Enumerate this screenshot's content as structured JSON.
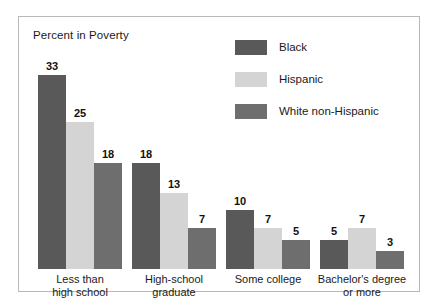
{
  "chart_data": {
    "type": "bar",
    "title": "Percent in Poverty",
    "xlabel": "",
    "ylabel": "",
    "ylim": [
      0,
      35
    ],
    "grid": false,
    "legend_position": "top-right",
    "categories": [
      "Less than\nhigh school",
      "High-school\ngraduate",
      "Some college",
      "Bachelor's degree\nor more"
    ],
    "category_lines": [
      [
        "Less than",
        "high school"
      ],
      [
        "High-school",
        "graduate"
      ],
      [
        "Some college",
        ""
      ],
      [
        "Bachelor's degree",
        "or more"
      ]
    ],
    "series": [
      {
        "name": "Black",
        "color": "#595959",
        "values": [
          33,
          18,
          10,
          5
        ]
      },
      {
        "name": "Hispanic",
        "color": "#d4d4d4",
        "values": [
          25,
          13,
          7,
          7
        ]
      },
      {
        "name": "White non-Hispanic",
        "color": "#6e6e6e",
        "values": [
          18,
          7,
          5,
          3
        ]
      }
    ]
  },
  "legend": {
    "items": [
      {
        "label": "Black",
        "color": "#595959"
      },
      {
        "label": "Hispanic",
        "color": "#d4d4d4"
      },
      {
        "label": "White non-Hispanic",
        "color": "#6e6e6e"
      }
    ]
  },
  "colors": {
    "frame_border": "#b8b8b8",
    "background": "#ffffff",
    "text": "#1a1a1a"
  }
}
